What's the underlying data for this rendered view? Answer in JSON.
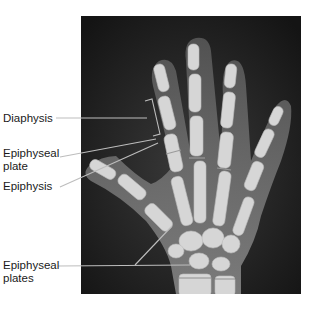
{
  "figure": {
    "labels": [
      {
        "id": "diaphysis",
        "text": "Diaphysis"
      },
      {
        "id": "epiphyseal-plate",
        "line1": "Epiphyseal",
        "line2": "plate"
      },
      {
        "id": "epiphysis",
        "text": "Epiphysis"
      },
      {
        "id": "epiphyseal-plates",
        "line1": "Epiphyseal",
        "line2": "plates"
      }
    ]
  },
  "colors": {
    "background": "#ffffff",
    "xray_dark": "#1a1a1a",
    "bone": "#d8d8d8",
    "soft_tissue": "#6a6a6a",
    "leader_line": "#bdbdbd",
    "text": "#1a1a1a"
  }
}
